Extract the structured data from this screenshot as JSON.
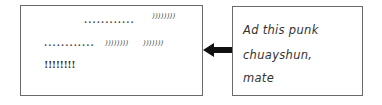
{
  "diagram": {
    "left_box": {
      "lines": [
        {
          "dots": "............",
          "commas": "))))))))"
        },
        {
          "dots": "............",
          "commas_a": "))))))))",
          "commas_b": ")))))))"
        },
        {
          "bangs": "!!!!!!!!"
        }
      ]
    },
    "arrow": {
      "direction": "left",
      "icon": "arrow-left-icon"
    },
    "right_box": {
      "lines": [
        "Ad this punk",
        "chuayshun,",
        "mate"
      ]
    },
    "colors": {
      "border": "#6a6a6a",
      "text": "#333333",
      "arrow": "#111111"
    }
  }
}
